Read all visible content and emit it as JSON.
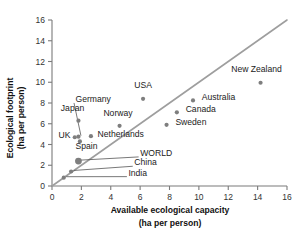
{
  "chart_data": {
    "type": "scatter",
    "title": "",
    "xlabel": "Available ecological capacity",
    "xlabel_units": "(ha per person)",
    "ylabel": "Ecological footprint",
    "ylabel_units": "(ha per person)",
    "xlim": [
      0,
      16
    ],
    "ylim": [
      0,
      16
    ],
    "xticks": [
      "0",
      "2",
      "4",
      "6",
      "8",
      "10",
      "12",
      "14",
      "16"
    ],
    "yticks": [
      "0",
      "2",
      "4",
      "6",
      "8",
      "10",
      "12",
      "14",
      "16"
    ],
    "grid": false,
    "legend": "none",
    "reference_line": {
      "name": "equality-line",
      "description": "y = x",
      "from": [
        0,
        0
      ],
      "to": [
        16,
        16
      ]
    },
    "points": [
      {
        "name": "India",
        "x": 0.8,
        "y": 0.8,
        "label": "India",
        "label_x": 5.2,
        "label_y": 1.0,
        "leader": true,
        "big": false
      },
      {
        "name": "China",
        "x": 1.3,
        "y": 1.4,
        "label": "China",
        "label_x": 5.6,
        "label_y": 2.0,
        "leader": true,
        "big": false
      },
      {
        "name": "WORLD",
        "x": 1.8,
        "y": 2.4,
        "label": "WORLD",
        "label_x": 6.0,
        "label_y": 2.9,
        "leader": true,
        "big": true
      },
      {
        "name": "Spain",
        "x": 1.9,
        "y": 4.3,
        "label": "Spain",
        "label_x": 1.6,
        "label_y": 3.6,
        "leader": false,
        "big": false
      },
      {
        "name": "UK",
        "x": 1.55,
        "y": 4.7,
        "label": "UK",
        "label_x": 0.45,
        "label_y": 4.6,
        "leader": false,
        "big": false
      },
      {
        "name": "Germany",
        "x": 1.8,
        "y": 4.75,
        "label": "Germany",
        "label_x": 1.6,
        "label_y": 8.1,
        "leader": true,
        "big": false
      },
      {
        "name": "Netherlands",
        "x": 2.65,
        "y": 4.8,
        "label": "Netherlands",
        "label_x": 3.1,
        "label_y": 4.7,
        "leader": false,
        "big": false
      },
      {
        "name": "Japan",
        "x": 1.8,
        "y": 6.3,
        "label": "Japan",
        "label_x": 0.6,
        "label_y": 7.2,
        "leader": false,
        "big": false
      },
      {
        "name": "Norway",
        "x": 4.6,
        "y": 5.8,
        "label": "Norway",
        "label_x": 3.5,
        "label_y": 6.7,
        "leader": false,
        "big": false
      },
      {
        "name": "USA",
        "x": 6.2,
        "y": 8.4,
        "label": "USA",
        "label_x": 5.6,
        "label_y": 9.4,
        "leader": false,
        "big": false
      },
      {
        "name": "Sweden",
        "x": 7.8,
        "y": 5.9,
        "label": "Sweden",
        "label_x": 8.4,
        "label_y": 5.9,
        "leader": false,
        "big": false
      },
      {
        "name": "Canada",
        "x": 8.5,
        "y": 7.1,
        "label": "Canada",
        "label_x": 9.1,
        "label_y": 7.1,
        "leader": false,
        "big": false
      },
      {
        "name": "Australia",
        "x": 9.6,
        "y": 8.25,
        "label": "Australia",
        "label_x": 10.2,
        "label_y": 8.25,
        "leader": false,
        "big": false
      },
      {
        "name": "New Zealand",
        "x": 14.2,
        "y": 9.95,
        "label": "New Zealand",
        "label_x": 12.2,
        "label_y": 11.0,
        "leader": false,
        "big": false
      }
    ]
  },
  "colors": {
    "marker": "#7e7e7e",
    "axis": "#7b7b7b",
    "reference_line": "#9e9e9e",
    "text": "#222222",
    "background": "#ffffff"
  }
}
